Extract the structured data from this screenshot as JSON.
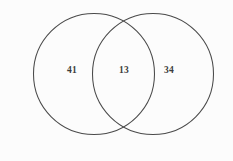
{
  "figure": {
    "type": "venn-diagram",
    "background_color": "#fcfcfc",
    "stroke_color": "#4a4a4a",
    "text_color": "#3c3c3c"
  },
  "chart_data": {
    "type": "venn",
    "title": "",
    "sets": [
      {
        "name": "left-set",
        "label": "",
        "cx": 94,
        "cy": 74,
        "r": 60.5
      },
      {
        "name": "right-set",
        "label": "",
        "cx": 153,
        "cy": 74,
        "r": 60.5
      }
    ],
    "regions": [
      {
        "id": "left-only",
        "value": "41",
        "x": 72,
        "y": 71
      },
      {
        "id": "intersection",
        "value": "13",
        "x": 124,
        "y": 71
      },
      {
        "id": "right-only",
        "value": "34",
        "x": 169,
        "y": 71
      }
    ],
    "values": [
      41,
      13,
      34
    ],
    "categories": [
      "left-only",
      "intersection",
      "right-only"
    ],
    "legend": [],
    "grid": false
  }
}
